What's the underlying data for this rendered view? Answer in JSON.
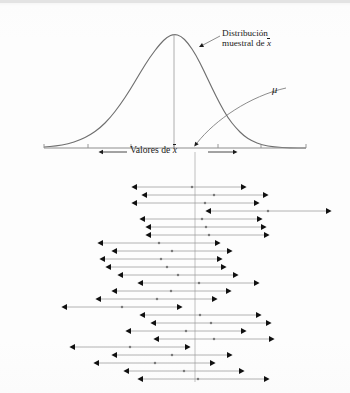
{
  "figure": {
    "kind": "statistics-textbook-figure",
    "language": "es",
    "background_color": "#fdfdfd",
    "ink_color": "#1b1b1b",
    "line_color": "#8d8d8d",
    "curve_color": "#6f6f6f"
  },
  "labels": {
    "distribution_line1": "Distribución",
    "distribution_line2_prefix": "muestral de ",
    "distribution_line2_symbol": "x",
    "mu_symbol": "μ",
    "axis_label_prefix": "Valores de ",
    "axis_label_symbol": "x"
  },
  "chart_data": {
    "type": "line",
    "xlabel": "Valores de x̄",
    "ylabel": "",
    "grid": false,
    "legend": null,
    "panels": [
      {
        "name": "sampling-distribution",
        "type": "line",
        "description": "Curva normal (campana) de la distribución muestral de la media",
        "axis": {
          "x_start": 44,
          "x_end": 306,
          "baseline_y": 148
        },
        "peak_x": 174,
        "peak_y": 34,
        "mean_symbol": "μ",
        "tick_positions": [
          44,
          88,
          131,
          174,
          218,
          261,
          306
        ],
        "curve_points": [
          [
            44,
            147
          ],
          [
            56,
            146
          ],
          [
            68,
            144
          ],
          [
            80,
            140
          ],
          [
            90,
            135
          ],
          [
            100,
            128
          ],
          [
            110,
            118
          ],
          [
            120,
            105
          ],
          [
            130,
            90
          ],
          [
            140,
            73
          ],
          [
            150,
            57
          ],
          [
            160,
            44
          ],
          [
            167,
            37
          ],
          [
            174,
            34
          ],
          [
            181,
            36
          ],
          [
            188,
            43
          ],
          [
            196,
            55
          ],
          [
            204,
            71
          ],
          [
            212,
            88
          ],
          [
            220,
            104
          ],
          [
            228,
            118
          ],
          [
            236,
            128
          ],
          [
            244,
            136
          ],
          [
            252,
            141
          ],
          [
            262,
            145
          ],
          [
            274,
            147
          ],
          [
            290,
            148
          ],
          [
            306,
            148
          ]
        ]
      },
      {
        "name": "confidence-intervals",
        "type": "interval-plot",
        "description": "Veinticinco intervalos de confianza con punto central (media muestral); las barras horizontales tienen puntas de flecha en ambos extremos",
        "mu_line_x": 195,
        "mu_line_y_start": 152,
        "mu_line_y_end": 382,
        "row_count": 25,
        "columns": [
          "left",
          "center",
          "right",
          "contains_mu"
        ],
        "rows": [
          {
            "left": 133,
            "center": 192,
            "right": 245,
            "y": 187,
            "contains_mu": true
          },
          {
            "left": 143,
            "center": 214,
            "right": 267,
            "y": 195,
            "contains_mu": true
          },
          {
            "left": 133,
            "center": 205,
            "right": 258,
            "y": 203,
            "contains_mu": true
          },
          {
            "left": 207,
            "center": 268,
            "right": 330,
            "y": 211,
            "contains_mu": false
          },
          {
            "left": 141,
            "center": 202,
            "right": 261,
            "y": 219,
            "contains_mu": true
          },
          {
            "left": 147,
            "center": 206,
            "right": 265,
            "y": 227,
            "contains_mu": true
          },
          {
            "left": 147,
            "center": 209,
            "right": 268,
            "y": 235,
            "contains_mu": true
          },
          {
            "left": 99,
            "center": 159,
            "right": 219,
            "y": 243,
            "contains_mu": true
          },
          {
            "left": 113,
            "center": 172,
            "right": 231,
            "y": 251,
            "contains_mu": true
          },
          {
            "left": 101,
            "center": 161,
            "right": 221,
            "y": 259,
            "contains_mu": true
          },
          {
            "left": 107,
            "center": 167,
            "right": 225,
            "y": 267,
            "contains_mu": true
          },
          {
            "left": 119,
            "center": 178,
            "right": 237,
            "y": 275,
            "contains_mu": true
          },
          {
            "left": 139,
            "center": 199,
            "right": 258,
            "y": 283,
            "contains_mu": true
          },
          {
            "left": 113,
            "center": 171,
            "right": 230,
            "y": 291,
            "contains_mu": true
          },
          {
            "left": 97,
            "center": 157,
            "right": 216,
            "y": 299,
            "contains_mu": true
          },
          {
            "left": 63,
            "center": 122,
            "right": 181,
            "y": 307,
            "contains_mu": false
          },
          {
            "left": 141,
            "center": 200,
            "right": 260,
            "y": 315,
            "contains_mu": true
          },
          {
            "left": 152,
            "center": 211,
            "right": 270,
            "y": 323,
            "contains_mu": true
          },
          {
            "left": 127,
            "center": 186,
            "right": 245,
            "y": 331,
            "contains_mu": true
          },
          {
            "left": 155,
            "center": 214,
            "right": 273,
            "y": 339,
            "contains_mu": true
          },
          {
            "left": 71,
            "center": 130,
            "right": 189,
            "y": 347,
            "contains_mu": false
          },
          {
            "left": 113,
            "center": 172,
            "right": 231,
            "y": 355,
            "contains_mu": true
          },
          {
            "left": 95,
            "center": 155,
            "right": 214,
            "y": 363,
            "contains_mu": true
          },
          {
            "left": 125,
            "center": 184,
            "right": 243,
            "y": 371,
            "contains_mu": true
          },
          {
            "left": 139,
            "center": 198,
            "right": 268,
            "y": 379,
            "contains_mu": true
          }
        ]
      }
    ]
  }
}
